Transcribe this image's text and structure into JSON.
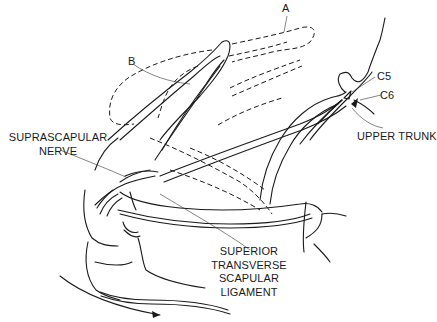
{
  "diagram": {
    "colors": {
      "line": "#1a1a1a",
      "background": "#ffffff"
    },
    "labels": {
      "a": "A",
      "b": "B",
      "c5": "C5",
      "c6": "C6",
      "upper_trunk": "UPPER TRUNK",
      "suprascapular_nerve": [
        "SUPRASCAPULAR",
        "NERVE"
      ],
      "ligament": [
        "SUPERIOR",
        "TRANSVERSE",
        "SCAPULAR",
        "LIGAMENT"
      ]
    }
  }
}
